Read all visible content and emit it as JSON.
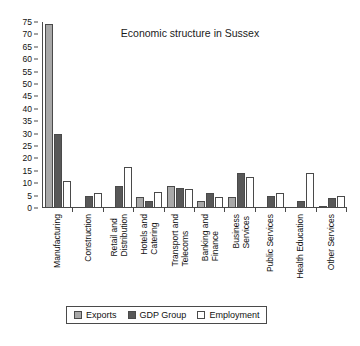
{
  "chart_data": {
    "type": "bar",
    "title": "Economic structure in Sussex",
    "xlabel": "",
    "ylabel": "",
    "ylim": [
      0,
      75
    ],
    "yticks": [
      0,
      5,
      10,
      15,
      20,
      25,
      30,
      35,
      40,
      45,
      50,
      55,
      60,
      65,
      70,
      75
    ],
    "grid": false,
    "legend_position": "bottom",
    "categories": [
      "Manufacturing",
      "Construction",
      "Retail and Distribution",
      "Hotels and Catering",
      "Transport and Telecoms",
      "Banking and Finance",
      "Business Services",
      "Public Services",
      "Health Education",
      "Other Services"
    ],
    "category_lines": [
      [
        "Manufacturing",
        ""
      ],
      [
        "Construction",
        ""
      ],
      [
        "Retail and",
        "Distribution"
      ],
      [
        "Hotels and",
        "Catering"
      ],
      [
        "Transport and",
        "Telecoms"
      ],
      [
        "Banking and",
        "Finance"
      ],
      [
        "Business",
        "Services"
      ],
      [
        "Public Services",
        ""
      ],
      [
        "Health Education",
        ""
      ],
      [
        "Other Services",
        ""
      ]
    ],
    "series": [
      {
        "name": "Exports",
        "color": "#a8a8a8",
        "values": [
          74,
          null,
          null,
          4.5,
          9,
          3,
          4.5,
          null,
          null,
          1
        ]
      },
      {
        "name": "GDP Group",
        "color": "#585858",
        "values": [
          30,
          5,
          9,
          3,
          8,
          6,
          14,
          5,
          3,
          4
        ]
      },
      {
        "name": "Employment",
        "color": "#ffffff",
        "values": [
          11,
          6,
          16.5,
          6.5,
          7.5,
          4.5,
          12.5,
          6,
          14,
          5
        ]
      }
    ]
  },
  "legend": {
    "items": [
      {
        "label": "Exports",
        "key": "exports"
      },
      {
        "label": "GDP Group",
        "key": "gdp"
      },
      {
        "label": "Employment",
        "key": "employment"
      }
    ]
  }
}
